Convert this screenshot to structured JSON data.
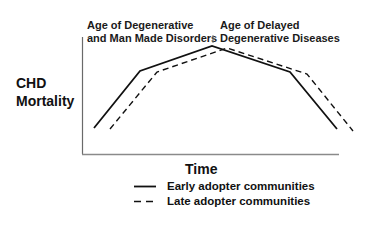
{
  "chart_data": {
    "type": "line",
    "title": "",
    "xlabel": "Time",
    "ylabel": "CHD Mortality",
    "grid": false,
    "axis_ticks": false,
    "legend_position": "bottom-center",
    "annotations": [
      {
        "text": "Age of Degenerative and Man Made Disorders",
        "lines": [
          "Age of Degenerative",
          "and Man Made Disorders"
        ],
        "position": "top-left of peak"
      },
      {
        "text": "Age of Delayed Degenerative Diseases",
        "lines": [
          "Age of Delayed",
          "Degenerative Diseases"
        ],
        "position": "top-right of peak"
      }
    ],
    "x": [
      "t0",
      "t1",
      "t2",
      "t3",
      "t4"
    ],
    "series": [
      {
        "name": "Early adopter communities",
        "style": "solid",
        "color": "#111111",
        "points": [
          {
            "x": 94,
            "y": 128
          },
          {
            "x": 140,
            "y": 71
          },
          {
            "x": 212,
            "y": 46
          },
          {
            "x": 290,
            "y": 72
          },
          {
            "x": 337,
            "y": 129
          }
        ],
        "relative_values": [
          10,
          70,
          95,
          70,
          10
        ]
      },
      {
        "name": "Late adopter communities",
        "style": "dashed",
        "color": "#111111",
        "points": [
          {
            "x": 110,
            "y": 129
          },
          {
            "x": 157,
            "y": 72
          },
          {
            "x": 227,
            "y": 48
          },
          {
            "x": 307,
            "y": 74
          },
          {
            "x": 353,
            "y": 131
          }
        ],
        "relative_values": [
          9,
          69,
          93,
          68,
          7
        ]
      }
    ]
  },
  "labels": {
    "y_axis_line1": "CHD",
    "y_axis_line2": "Mortality",
    "x_axis": "Time",
    "era_left_line1": "Age of Degenerative",
    "era_left_line2": "and Man Made Disorders",
    "era_right_line1": "Age of Delayed",
    "era_right_line2": "Degenerative Diseases"
  },
  "legend": {
    "items": [
      {
        "label": "Early adopter communities",
        "style": "solid"
      },
      {
        "label": "Late adopter communities",
        "style": "dashed"
      }
    ]
  },
  "colors": {
    "line": "#111111",
    "axis": "#666666",
    "background": "#ffffff"
  }
}
